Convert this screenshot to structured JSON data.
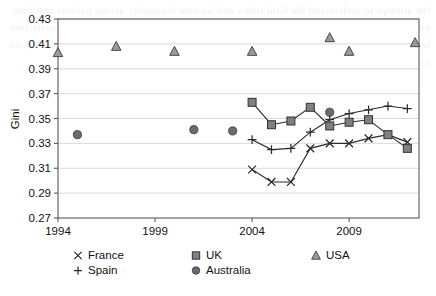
{
  "figure": {
    "background_color": "#ffffff",
    "plot_border_color": "#5a5a5a",
    "gridline_color": "#c8c8c8"
  },
  "chart_data": {
    "type": "line",
    "title": "",
    "subtitle": "",
    "xlabel": "",
    "ylabel": "Gini",
    "xlim": [
      1994,
      2012.6
    ],
    "ylim": [
      0.27,
      0.43
    ],
    "xticks": [
      1994,
      1999,
      2004,
      2009
    ],
    "xtick_labels": [
      "1994",
      "1999",
      "2004",
      "2009"
    ],
    "yticks": [
      0.27,
      0.29,
      0.31,
      0.33,
      0.35,
      0.37,
      0.39,
      0.41,
      0.43
    ],
    "ytick_labels": [
      "0.27",
      "0.29",
      "0.31",
      "0.33",
      "0.35",
      "0.37",
      "0.39",
      "0.41",
      "0.43"
    ],
    "grid": "horizontal",
    "legend_position": "below",
    "series": [
      {
        "name": "France",
        "marker": "x",
        "color": "#2b2b2b",
        "connected": true,
        "x": [
          2004,
          2005,
          2006,
          2007,
          2008,
          2009,
          2010,
          2011,
          2012
        ],
        "values": [
          0.309,
          0.299,
          0.299,
          0.326,
          0.33,
          0.33,
          0.334,
          0.337,
          0.331
        ]
      },
      {
        "name": "Spain",
        "marker": "plus",
        "color": "#2b2b2b",
        "connected": true,
        "x": [
          2004,
          2005,
          2006,
          2007,
          2008,
          2009,
          2010,
          2011,
          2012
        ],
        "values": [
          0.333,
          0.325,
          0.326,
          0.339,
          0.349,
          0.354,
          0.357,
          0.36,
          0.358
        ]
      },
      {
        "name": "UK",
        "marker": "square",
        "color": "#808080",
        "connected": true,
        "x": [
          2004,
          2005,
          2006,
          2007,
          2008,
          2009,
          2010,
          2011,
          2012
        ],
        "values": [
          0.363,
          0.345,
          0.348,
          0.359,
          0.344,
          0.347,
          0.349,
          0.337,
          0.326
        ]
      },
      {
        "name": "Australia",
        "marker": "circle",
        "color": "#6b6b6b",
        "connected": false,
        "x": [
          1995,
          2001,
          2003,
          2008
        ],
        "values": [
          0.337,
          0.341,
          0.34,
          0.355
        ]
      },
      {
        "name": "USA",
        "marker": "triangle",
        "color": "#9a9a9a",
        "connected": false,
        "x": [
          1994,
          1997,
          2000,
          2004,
          2008,
          2009,
          2012.4
        ],
        "values": [
          0.403,
          0.408,
          0.404,
          0.404,
          0.415,
          0.404,
          0.411
        ]
      }
    ]
  },
  "legend": {
    "entries": [
      {
        "label": "France",
        "marker": "x",
        "color": "#2b2b2b"
      },
      {
        "label": "Spain",
        "marker": "plus",
        "color": "#2b2b2b"
      },
      {
        "label": "UK",
        "marker": "square",
        "color": "#808080"
      },
      {
        "label": "Australia",
        "marker": "circle",
        "color": "#6b6b6b"
      },
      {
        "label": "USA",
        "marker": "triangle",
        "color": "#9a9a9a"
      }
    ]
  },
  "page_bleed": {
    "text": "the attempt to understand the Gini index and income inequality across nations and time periods, with reference to the observed data. The series above show the Gini coefficient levels for five advanced economies and reveal a pattern of divergence that is broadly consistent with the literature on redistribution and market income dispersion."
  }
}
